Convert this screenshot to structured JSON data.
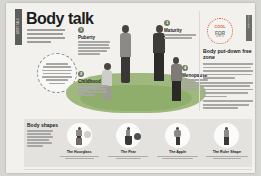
{
  "spine": {
    "label": "BODY TALK"
  },
  "header": {
    "title": "Body talk",
    "standfirst": "Our bodies change all the time, throughout our lives. Women have four stages to their life cycle."
  },
  "pull_quote": {
    "text": "Every body is different and every body changes at its own pace — there is no single right way to look."
  },
  "badge": {
    "line1": "COOL",
    "line2": "FOR",
    "line3": "GIRLS"
  },
  "stages": [
    {
      "number": "1",
      "heading": "Puberty",
      "body": "Puberty is when your body matures and you start to develop the shape you will have as an adult. It usually begins between the ages of 9 and 13."
    },
    {
      "number": "2",
      "heading": "Childhood",
      "body": "The first stage is childhood, when girls and boys have much the same body shape."
    },
    {
      "number": "3",
      "heading": "Maturity",
      "body": "When you are an adult your body settles into its grown-up shape."
    },
    {
      "number": "4",
      "heading": "Menopause",
      "body": "Menopause happens later in life, when periods stop and the body changes again."
    }
  ],
  "sidebar": {
    "heading": "Body put-down free zone",
    "paragraph1": "There is no one way to look and no one perfect body, whatever the magazines might tell you. Every single body is different.",
    "paragraph2": "The very best thing you can do for your body is to look after it, feed it well and move it, and be kind to it.",
    "paragraph3": "So try not to put your own body down, and don't let anyone else do it either."
  },
  "panel": {
    "heading": "Body shapes",
    "intro": "Most bodies fall loosely into one of four shapes, but plenty of people are a mix of more than one.",
    "shapes": [
      {
        "label": "The Hourglass",
        "desc": "Bust and hips are a similar width with a narrower waist."
      },
      {
        "label": "The Pear",
        "desc": "Hips are wider than the bust and shoulders."
      },
      {
        "label": "The Apple",
        "desc": "Weight is carried around the middle, with slimmer legs."
      },
      {
        "label": "The Ruler Shape",
        "desc": "Bust, waist and hips are a similar width all the way down."
      }
    ]
  },
  "footer": {
    "page_number": ""
  }
}
